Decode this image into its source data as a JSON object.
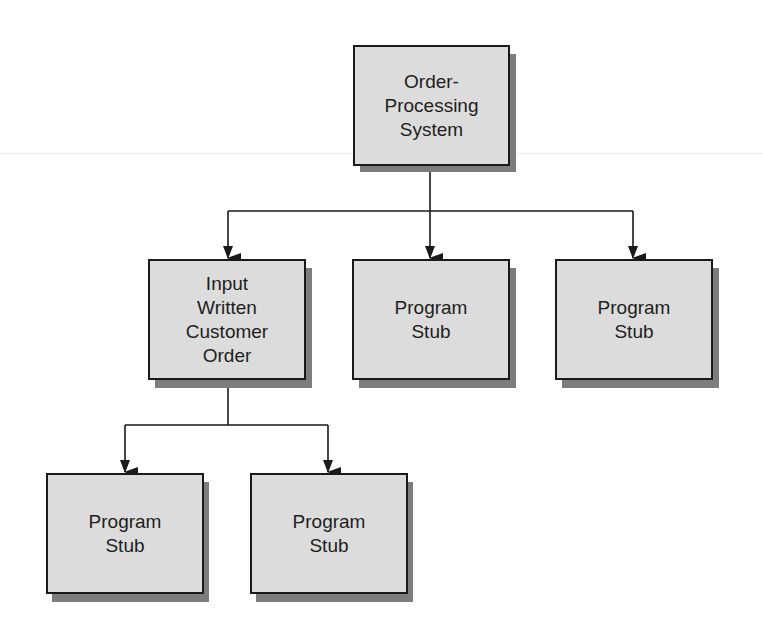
{
  "diagram": {
    "type": "hierarchy-chart",
    "colors": {
      "box_fill": "#dcdcdc",
      "box_border": "#1a1a1a",
      "shadow": "#7d7d7d",
      "line": "#1a1a1a",
      "text": "#1e1e1e"
    },
    "nodes": [
      {
        "id": "root",
        "label": "Order-\nProcessing\nSystem",
        "level": 0
      },
      {
        "id": "input-order",
        "label": "Input\nWritten\nCustomer\nOrder",
        "level": 1,
        "parent": "root"
      },
      {
        "id": "stub-1",
        "label": "Program\nStub",
        "level": 1,
        "parent": "root"
      },
      {
        "id": "stub-2",
        "label": "Program\nStub",
        "level": 1,
        "parent": "root"
      },
      {
        "id": "stub-3",
        "label": "Program\nStub",
        "level": 2,
        "parent": "input-order"
      },
      {
        "id": "stub-4",
        "label": "Program\nStub",
        "level": 2,
        "parent": "input-order"
      }
    ],
    "edges": [
      {
        "from": "root",
        "to": "input-order"
      },
      {
        "from": "root",
        "to": "stub-1"
      },
      {
        "from": "root",
        "to": "stub-2"
      },
      {
        "from": "input-order",
        "to": "stub-3"
      },
      {
        "from": "input-order",
        "to": "stub-4"
      }
    ]
  }
}
